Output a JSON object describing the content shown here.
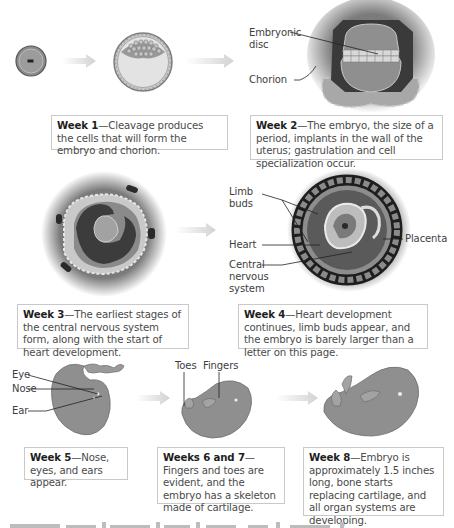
{
  "diagram": {
    "stages": [
      {
        "id": "week1",
        "heading": "Week 1",
        "text": "—Cleavage produces the cells that will form the embryo and chorion.",
        "labels": []
      },
      {
        "id": "week2",
        "heading": "Week 2",
        "text": "—The embryo, the size of a period, implants in the wall of the uterus; gastrulation and cell specialization occur.",
        "labels": [
          "Embryonic disc",
          "Chorion"
        ]
      },
      {
        "id": "week3",
        "heading": "Week 3",
        "text": "—The earliest stages of the central nervous system form, along with the start of heart development.",
        "labels": []
      },
      {
        "id": "week4",
        "heading": "Week 4",
        "text": "—Heart development continues, limb buds appear, and the embryo is barely larger than a letter on this page.",
        "labels": [
          "Limb buds",
          "Heart",
          "Central nervous system",
          "Placenta"
        ]
      },
      {
        "id": "week5",
        "heading": "Week 5",
        "text": "—Nose, eyes, and ears appear.",
        "labels": [
          "Eye",
          "Nose",
          "Ear"
        ]
      },
      {
        "id": "week6-7",
        "heading": "Weeks 6 and 7",
        "text": "—Fingers and toes are evident, and the embryo has a skeleton made of cartilage.",
        "labels": [
          "Toes",
          "Fingers"
        ]
      },
      {
        "id": "week8",
        "heading": "Week 8",
        "text": "—Embryo is approximately 1.5 inches long, bone starts replacing cartilage, and all organ systems are developing.",
        "labels": []
      }
    ],
    "label_text": {
      "embryonic_disc_1": "Embryonic",
      "embryonic_disc_2": "disc",
      "chorion": "Chorion",
      "limb_buds_1": "Limb",
      "limb_buds_2": "buds",
      "heart": "Heart",
      "cns_1": "Central",
      "cns_2": "nervous",
      "cns_3": "system",
      "placenta": "Placenta",
      "eye": "Eye",
      "nose": "Nose",
      "ear": "Ear",
      "toes": "Toes",
      "fingers": "Fingers"
    },
    "colors": {
      "tissue_gray": "#8e8e8e",
      "dark_layer": "#3d3d3d",
      "light_layer": "#cfcfcf",
      "arrow": "#d9d9d9",
      "caption_border": "#c9c9c9",
      "text": "#4a4a4a"
    }
  }
}
